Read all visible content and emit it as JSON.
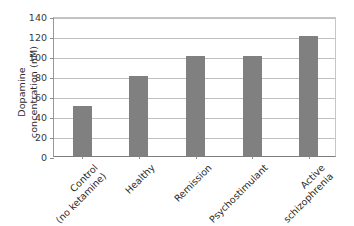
{
  "chart_data": {
    "type": "bar",
    "title": "",
    "subtitle": "",
    "xlabel": "",
    "ylabel": "Dopamine concentration (nM)",
    "ylabel_lines": [
      "Dopamine",
      "concentration (nM)"
    ],
    "categories": [
      "Control (no ketamine)",
      "Healthy",
      "Remission",
      "Psychostimulant",
      "Active schizophrenia"
    ],
    "category_lines": [
      [
        "Control",
        "(no ketamine)"
      ],
      [
        "Healthy"
      ],
      [
        "Remission"
      ],
      [
        "Psychostimulant"
      ],
      [
        "Active",
        "schizophrenia"
      ]
    ],
    "values": [
      50,
      80,
      100,
      100,
      120
    ],
    "ylim": [
      0,
      140
    ],
    "ytick_values": [
      0,
      20,
      40,
      60,
      80,
      100,
      120,
      140
    ],
    "ytick_labels": [
      "0",
      "20",
      "40",
      "60",
      "80",
      "100",
      "120",
      "140"
    ],
    "grid": true,
    "grid_axis": "y",
    "legend": false,
    "legend_position": "none",
    "bar_color": "#808080",
    "grid_color": "#c0c0c0",
    "axis_color": "#7d7d7d",
    "background_color": "#ffffff",
    "xlabel_rotation": -45
  }
}
